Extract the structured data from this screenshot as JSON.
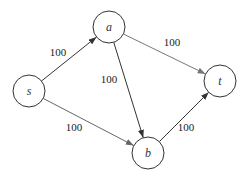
{
  "diagram": {
    "type": "flow-network",
    "nodes": [
      {
        "id": "s",
        "label": "s",
        "x": 29,
        "y": 91,
        "r": 16
      },
      {
        "id": "a",
        "label": "a",
        "x": 109,
        "y": 27,
        "r": 16
      },
      {
        "id": "b",
        "label": "b",
        "x": 148,
        "y": 153,
        "r": 16
      },
      {
        "id": "t",
        "label": "t",
        "x": 220,
        "y": 81,
        "r": 16
      }
    ],
    "edges": [
      {
        "from": "s",
        "to": "a",
        "capacity": "100",
        "color": "#333333",
        "label_x": 58,
        "label_y": 56
      },
      {
        "from": "s",
        "to": "b",
        "capacity": "100",
        "color": "#666666",
        "label_x": 74,
        "label_y": 131
      },
      {
        "from": "a",
        "to": "b",
        "capacity": "100",
        "color": "#333333",
        "label_x": 109,
        "label_y": 83
      },
      {
        "from": "a",
        "to": "t",
        "capacity": "100",
        "color": "#777777",
        "label_x": 172,
        "label_y": 46
      },
      {
        "from": "b",
        "to": "t",
        "capacity": "100",
        "color": "#333333",
        "label_x": 186,
        "label_y": 131
      }
    ]
  }
}
